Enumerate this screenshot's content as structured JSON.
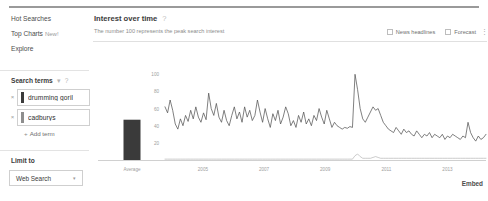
{
  "sidebar": {
    "nav": [
      {
        "label": "Hot Searches",
        "badge": ""
      },
      {
        "label": "Top Charts",
        "badge": "New!"
      },
      {
        "label": "Explore",
        "badge": ""
      }
    ],
    "search_terms": {
      "heading": "Search terms",
      "heading_dots": "▾ ?",
      "terms": [
        {
          "label": "drumming goril",
          "color": "#3b3b3b",
          "remove_icon": "×"
        },
        {
          "label": "cadburys",
          "color": "#8e8e8e",
          "remove_icon": "×"
        }
      ],
      "add_label": "Add term",
      "add_plus": "+"
    },
    "limit_to": {
      "heading": "Limit to",
      "selected": "Web Search",
      "caret": "▾",
      "options": [
        "Web Search",
        "Image Search",
        "News Search",
        "Google Shopping",
        "YouTube Search"
      ]
    }
  },
  "main": {
    "title": "Interest over time",
    "title_dots": "?",
    "subtitle": "The number 100 represents the peak search interest",
    "toggles": [
      {
        "label": "News headlines",
        "checked": false
      },
      {
        "label": "Forecast",
        "checked": false
      }
    ],
    "kebab_icon": "⋮",
    "embed_label": "Embed"
  },
  "chart_data": {
    "type": "line",
    "title": "Interest over time",
    "xlabel": "",
    "ylabel": "",
    "ylim": [
      0,
      105
    ],
    "grid": false,
    "legend": "none",
    "y_ticks": [
      20,
      40,
      60,
      80,
      100
    ],
    "x_ticks": [
      "2005",
      "2007",
      "2009",
      "2011",
      "2013"
    ],
    "average_bar": {
      "label": "Average",
      "value": 47,
      "color": "#3a3a3a"
    },
    "series": [
      {
        "name": "drumming goril",
        "color": "#555555",
        "values": [
          62,
          55,
          70,
          58,
          42,
          36,
          48,
          40,
          52,
          45,
          58,
          48,
          62,
          50,
          44,
          55,
          47,
          78,
          60,
          52,
          66,
          50,
          44,
          58,
          46,
          40,
          52,
          62,
          48,
          56,
          44,
          62,
          50,
          58,
          46,
          52,
          70,
          56,
          44,
          60,
          48,
          38,
          54,
          46,
          58,
          42,
          50,
          62,
          54,
          40,
          46,
          38,
          52,
          44,
          56,
          42,
          48,
          40,
          52,
          46,
          60,
          50,
          42,
          58,
          48,
          38,
          44,
          40,
          38,
          36,
          38,
          37,
          39,
          38,
          100,
          82,
          60,
          48,
          44,
          50,
          56,
          62,
          58,
          60,
          52,
          44,
          40,
          36,
          34,
          32,
          38,
          34,
          30,
          36,
          32,
          34,
          30,
          28,
          34,
          30,
          26,
          30,
          28,
          32,
          26,
          30,
          28,
          26,
          30,
          24,
          28,
          26,
          30,
          28,
          26,
          24,
          28,
          26,
          44,
          32,
          26,
          22,
          28,
          24,
          26,
          30
        ]
      },
      {
        "name": "cadburys",
        "color": "#b0b0b0",
        "values": [
          1,
          1,
          1,
          1,
          1,
          1,
          1,
          1,
          1,
          1,
          1,
          1,
          1,
          1,
          1,
          1,
          1,
          1,
          1,
          1,
          1,
          1,
          1,
          1,
          1,
          1,
          1,
          1,
          1,
          1,
          1,
          1,
          1,
          1,
          1,
          1,
          1,
          1,
          1,
          1,
          1,
          1,
          1,
          1,
          1,
          1,
          1,
          1,
          1,
          1,
          1,
          1,
          1,
          1,
          1,
          1,
          1,
          1,
          1,
          1,
          1,
          1,
          1,
          1,
          1,
          1,
          1,
          1,
          1,
          1,
          1,
          1,
          1,
          1,
          5,
          7,
          4,
          2,
          2,
          2,
          2,
          3,
          4,
          3,
          2,
          2,
          2,
          2,
          2,
          2,
          2,
          2,
          2,
          2,
          2,
          2,
          2,
          2,
          2,
          2,
          2,
          2,
          2,
          2,
          2,
          2,
          2,
          2,
          2,
          2,
          2,
          2,
          2,
          2,
          2,
          2,
          2,
          2,
          2,
          2,
          2,
          2,
          2,
          2,
          2,
          2
        ]
      }
    ]
  }
}
